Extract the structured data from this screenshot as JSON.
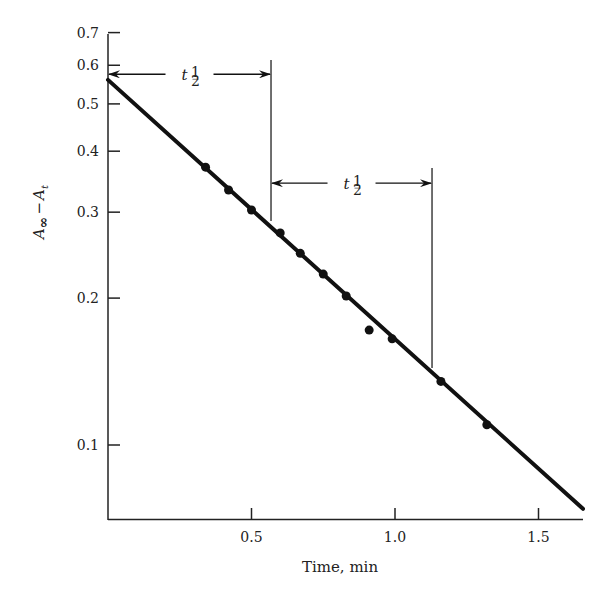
{
  "chart_data": {
    "type": "scatter",
    "title": "",
    "xlabel": "Time, min",
    "ylabel": "A∞ − At",
    "ylabel_parts": {
      "A": "A",
      "inf": "∞",
      "minus": "−",
      "t": "t"
    },
    "xscale": "linear",
    "yscale": "log",
    "xlim": [
      0,
      1.66
    ],
    "ylim": [
      0.074,
      0.7
    ],
    "grid": false,
    "legend": null,
    "x_ticks": [
      0.5,
      1.0,
      1.5
    ],
    "x_tick_labels": [
      "0.5",
      "1.0",
      "1.5"
    ],
    "y_ticks": [
      0.1,
      0.2,
      0.3,
      0.4,
      0.5,
      0.6,
      0.7
    ],
    "y_tick_labels": [
      "0.1",
      "0.2",
      "0.3",
      "0.4",
      "0.5",
      "0.6",
      "0.7"
    ],
    "series": [
      {
        "name": "measured points",
        "type": "scatter",
        "x": [
          0.34,
          0.42,
          0.5,
          0.6,
          0.67,
          0.75,
          0.83,
          0.91,
          0.99,
          1.16,
          1.32
        ],
        "y": [
          0.371,
          0.333,
          0.303,
          0.272,
          0.247,
          0.224,
          0.202,
          0.172,
          0.165,
          0.135,
          0.11
        ]
      },
      {
        "name": "first-order fit",
        "type": "line",
        "x": [
          0.0,
          1.655
        ],
        "y": [
          0.56,
          0.074
        ]
      }
    ],
    "annotations": [
      {
        "label": "t",
        "subscript": "1/2",
        "text": "t½",
        "from_x": 0.0,
        "to_x": 0.568,
        "at_y": 0.575,
        "description": "first half-life, horizontal double arrow"
      },
      {
        "label": "t",
        "subscript": "1/2",
        "text": "t½",
        "from_x": 0.568,
        "to_x": 1.129,
        "at_y": 0.344,
        "description": "second half-life, horizontal double arrow"
      }
    ],
    "half_life_markers_x": [
      0.568,
      1.129
    ]
  },
  "labels": {
    "half": "1",
    "half_den": "2",
    "t": "t"
  }
}
